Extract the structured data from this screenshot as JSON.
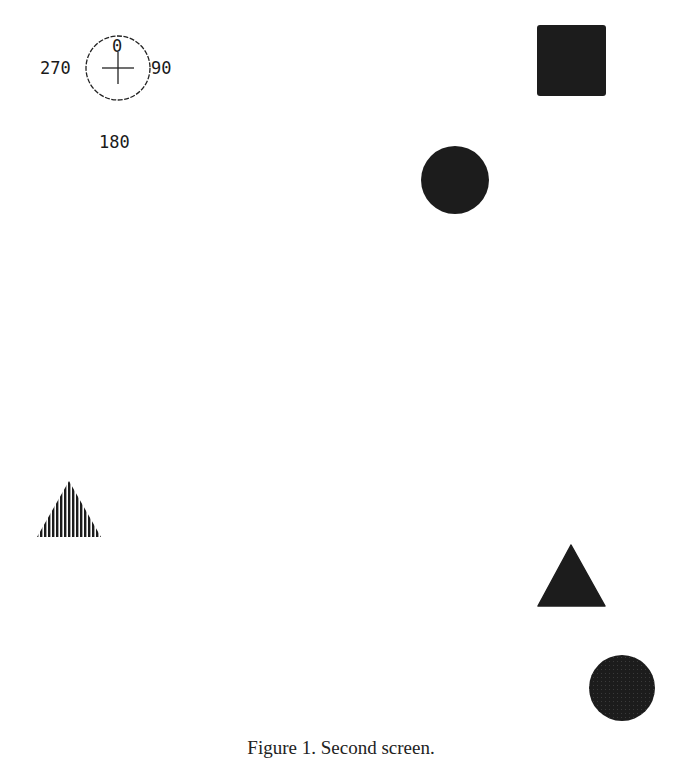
{
  "compass": {
    "label_top": "0",
    "label_right": "90",
    "label_bottom": "180",
    "label_left": "270",
    "center": [
      118,
      68
    ],
    "radius": 32
  },
  "shapes": [
    {
      "id": "square",
      "type": "square",
      "fill": "solid",
      "x": 537,
      "y": 25,
      "w": 69,
      "h": 71,
      "color": "#1c1c1c"
    },
    {
      "id": "circle-top",
      "type": "circle",
      "fill": "solid",
      "cx": 455,
      "cy": 180,
      "r": 34,
      "color": "#1c1c1c"
    },
    {
      "id": "triangle-hatched",
      "type": "triangle",
      "fill": "hatched",
      "points": [
        [
          69,
          481
        ],
        [
          37,
          537
        ],
        [
          101,
          537
        ]
      ],
      "color": "#1c1c1c"
    },
    {
      "id": "triangle-solid",
      "type": "triangle",
      "fill": "solid",
      "points": [
        [
          571,
          545
        ],
        [
          538,
          606
        ],
        [
          605,
          606
        ]
      ],
      "color": "#1c1c1c"
    },
    {
      "id": "circle-bottom",
      "type": "circle",
      "fill": "textured",
      "cx": 622,
      "cy": 688,
      "r": 33,
      "color": "#1c1c1c"
    }
  ],
  "caption": "Figure 1.  Second screen."
}
